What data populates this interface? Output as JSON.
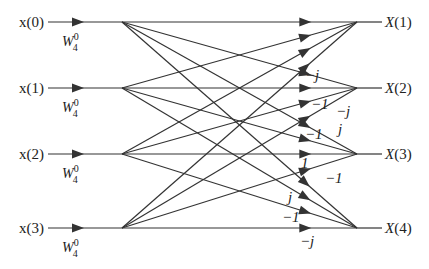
{
  "diagram": {
    "colors": {
      "line": "#333333",
      "text": "#222222",
      "background": "#ffffff"
    },
    "rows_y": [
      22,
      88,
      154,
      228
    ],
    "input_x": {
      "label_right": 44,
      "line_start": 48,
      "arrow": 78,
      "node": 122
    },
    "output_x": {
      "node": 357,
      "line_end": 382,
      "label_left": 385
    },
    "inputs": [
      {
        "label": "x(0)",
        "twiddle": "W",
        "twiddle_sub": "4",
        "twiddle_sup": "0"
      },
      {
        "label": "x(1)",
        "twiddle": "W",
        "twiddle_sub": "4",
        "twiddle_sup": "0"
      },
      {
        "label": "x(2)",
        "twiddle": "W",
        "twiddle_sub": "4",
        "twiddle_sup": "0"
      },
      {
        "label": "x(3)",
        "twiddle": "W",
        "twiddle_sub": "4",
        "twiddle_sup": "0"
      }
    ],
    "outputs": [
      {
        "label": "X(1)"
      },
      {
        "label": "X(2)"
      },
      {
        "label": "X(3)"
      },
      {
        "label": "X(4)"
      }
    ],
    "edges": [
      {
        "from": 0,
        "to": 0,
        "weight": ""
      },
      {
        "from": 1,
        "to": 0,
        "weight": ""
      },
      {
        "from": 2,
        "to": 0,
        "weight": ""
      },
      {
        "from": 3,
        "to": 0,
        "weight": ""
      },
      {
        "from": 0,
        "to": 1,
        "weight": ""
      },
      {
        "from": 1,
        "to": 1,
        "weight": "−j"
      },
      {
        "from": 2,
        "to": 1,
        "weight": "−1"
      },
      {
        "from": 3,
        "to": 1,
        "weight": "−j"
      },
      {
        "from": 0,
        "to": 2,
        "weight": ""
      },
      {
        "from": 1,
        "to": 2,
        "weight": "−1"
      },
      {
        "from": 2,
        "to": 2,
        "weight": "1"
      },
      {
        "from": 3,
        "to": 2,
        "weight": "−1"
      },
      {
        "from": 0,
        "to": 3,
        "weight": ""
      },
      {
        "from": 1,
        "to": 3,
        "weight": "j"
      },
      {
        "from": 2,
        "to": 3,
        "weight": "−1"
      },
      {
        "from": 3,
        "to": 3,
        "weight": "−j"
      }
    ],
    "weight_labels": [
      {
        "text": "−j",
        "x": 305,
        "y": 80
      },
      {
        "text": "−1",
        "x": 311,
        "y": 109
      },
      {
        "text": "−j",
        "x": 336,
        "y": 116
      },
      {
        "text": "j",
        "x": 338,
        "y": 134
      },
      {
        "text": "−1",
        "x": 305,
        "y": 139
      },
      {
        "text": "1",
        "x": 301,
        "y": 168
      },
      {
        "text": "−1",
        "x": 325,
        "y": 183
      },
      {
        "text": "j",
        "x": 288,
        "y": 202
      },
      {
        "text": "−1",
        "x": 282,
        "y": 222
      },
      {
        "text": "−j",
        "x": 300,
        "y": 246
      },
      {
        "text": "j",
        "x": 340,
        "y": 134
      }
    ]
  }
}
